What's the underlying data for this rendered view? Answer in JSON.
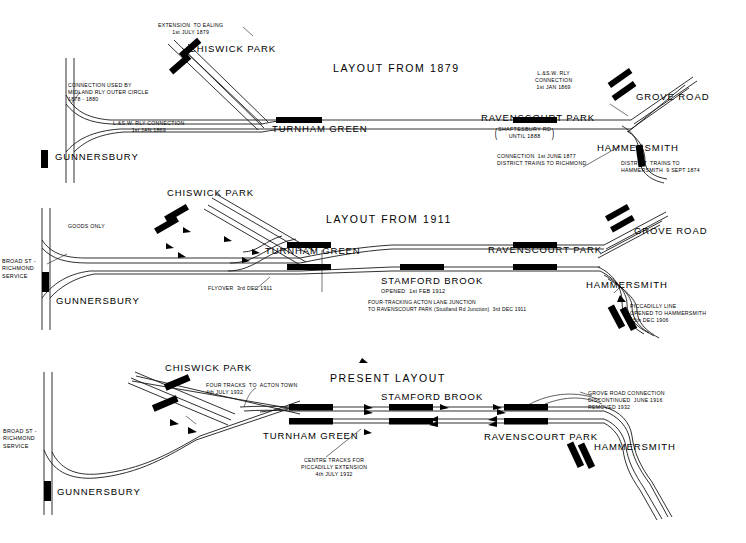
{
  "document": {
    "kind": "railway-track-layout-diagram",
    "background_color": "#ffffff",
    "ink_color": "#000000"
  },
  "panels": [
    {
      "id": "layout-1879",
      "title": "LAYOUT FROM 1879",
      "stations": [
        {
          "name": "GUNNERSBURY"
        },
        {
          "name": "CHISWICK PARK"
        },
        {
          "name": "TURNHAM GREEN"
        },
        {
          "name": "RAVENSCOURT PARK"
        },
        {
          "name": "GROVE ROAD"
        },
        {
          "name": "HAMMERSMITH"
        }
      ],
      "notes": [
        {
          "id": "ealing",
          "text": "EXTENSION  TO EALING\n1st JULY 1879"
        },
        {
          "id": "midland",
          "text": "CONNECTION USED BY\nMIDLAND RLY OUTER CIRCLE\n1878 - 1880"
        },
        {
          "id": "lswr-west",
          "text": "L.&S.W. RLY CONNECTION\n1st JAN 1869"
        },
        {
          "id": "lswr-east",
          "text": "L.&S.W. RLY\nCONNECTION\n1st JAN 1869"
        },
        {
          "id": "ravenscourt-alt",
          "text": "SHAFTESBURY RD\nUNTIL 1888"
        },
        {
          "id": "richmond-conn",
          "text": "CONNECTION  1st JUNE 1877\nDISTRICT TRAINS TO RICHMOND"
        },
        {
          "id": "hammersmith-trains",
          "text": "DISTRICT  TRAINS TO\nHAMMERSMITH  9 SEPT 1874"
        }
      ]
    },
    {
      "id": "layout-1911",
      "title": "LAYOUT FROM 1911",
      "stations": [
        {
          "name": "GUNNERSBURY"
        },
        {
          "name": "CHISWICK PARK"
        },
        {
          "name": "TURNHAM GREEN"
        },
        {
          "name": "STAMFORD BROOK"
        },
        {
          "name": "RAVENSCOURT PARK"
        },
        {
          "name": "GROVE ROAD"
        },
        {
          "name": "HAMMERSMITH"
        }
      ],
      "notes": [
        {
          "id": "broad-st",
          "text": "BROAD ST -\nRICHMOND\nSERVICE"
        },
        {
          "id": "goods-only",
          "text": "GOODS ONLY"
        },
        {
          "id": "flyover",
          "text": "FLYOVER  3rd DEC 1911"
        },
        {
          "id": "stamford-opened",
          "text": "OPENED  1st FEB 1912"
        },
        {
          "id": "four-tracking",
          "text": "FOUR-TRACKING ACTON LANE JUNCTION\nTO RAVENSCOURT PARK (Studland Rd Junction)  3rd DEC 1911"
        },
        {
          "id": "piccadilly",
          "text": "PICCADILLY LINE\nOPENED TO HAMMERSMITH\n15th DEC 1906"
        }
      ]
    },
    {
      "id": "layout-present",
      "title": "PRESENT LAYOUT",
      "stations": [
        {
          "name": "GUNNERSBURY"
        },
        {
          "name": "CHISWICK PARK"
        },
        {
          "name": "TURNHAM GREEN"
        },
        {
          "name": "STAMFORD BROOK"
        },
        {
          "name": "RAVENSCOURT PARK"
        },
        {
          "name": "HAMMERSMITH"
        }
      ],
      "notes": [
        {
          "id": "broad-st",
          "text": "BROAD ST -\nRICHMOND\nSERVICE"
        },
        {
          "id": "four-tracks",
          "text": "FOUR TRACKS  TO  ACTON TOWN\n4th JULY 1932"
        },
        {
          "id": "centre-tracks",
          "text": "CENTRE TRACKS FOR\nPICCADILLY EXTENSION\n4th JULY 1932"
        },
        {
          "id": "grove-road-removed",
          "text": "GROVE ROAD CONNECTION\nDISCONTINUED  JUNE 1916\nREMOVED 1932"
        }
      ]
    }
  ]
}
